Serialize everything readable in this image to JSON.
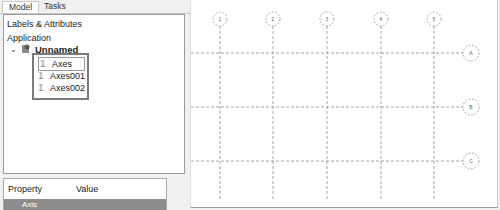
{
  "tabs": [
    {
      "label": "Model",
      "active": true
    },
    {
      "label": "Tasks",
      "active": false
    }
  ],
  "tree": {
    "section_labels": "Labels & Attributes",
    "section_application": "Application",
    "root": {
      "label": "Unnamed",
      "icon": "document-icon",
      "expanded": true
    },
    "children": [
      {
        "label": "Axes",
        "icon": "axes-icon",
        "selected": true
      },
      {
        "label": "Axes001",
        "icon": "axes-icon",
        "selected": false
      },
      {
        "label": "Axes002",
        "icon": "axes-icon",
        "selected": false
      }
    ]
  },
  "property_panel": {
    "col_property": "Property",
    "col_value": "Value",
    "group": "Axis"
  },
  "view": {
    "column_bubbles": [
      "1",
      "2",
      "3",
      "4",
      "5"
    ],
    "row_bubbles": [
      "A",
      "B",
      "C"
    ]
  }
}
